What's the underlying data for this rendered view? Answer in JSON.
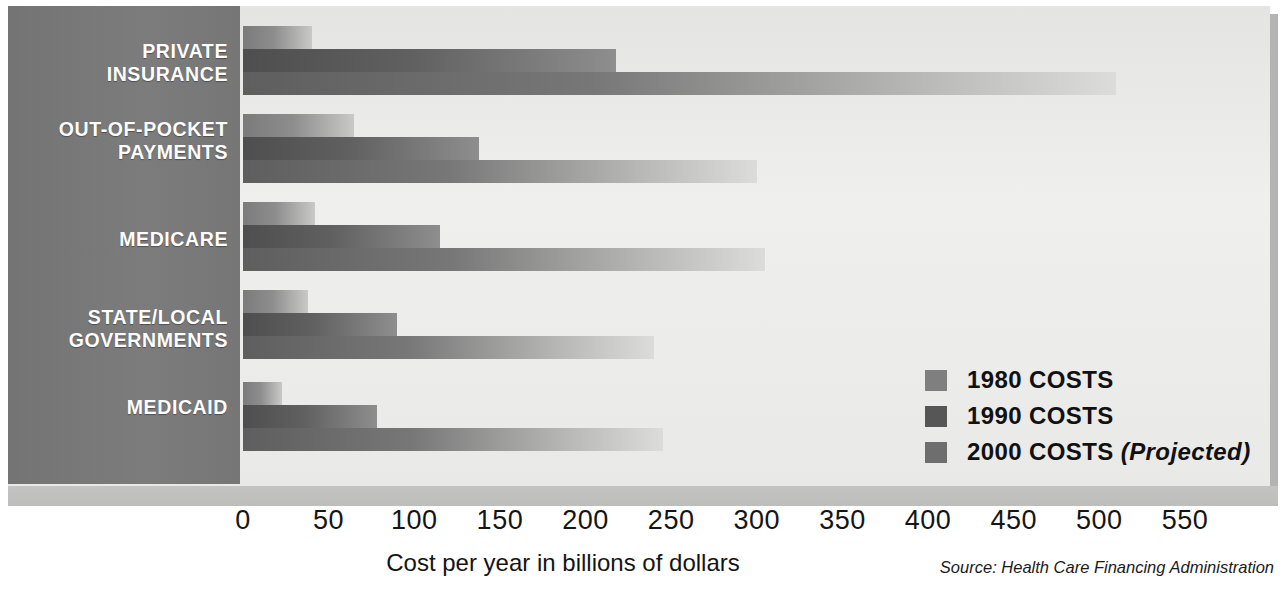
{
  "chart_data": {
    "type": "bar",
    "orientation": "horizontal",
    "title": "",
    "xlabel": "Cost per year in billions of dollars",
    "ylabel": "",
    "xlim": [
      0,
      550
    ],
    "xticks": [
      0,
      50,
      100,
      150,
      200,
      250,
      300,
      350,
      400,
      450,
      500,
      550
    ],
    "xtick_labels": [
      "0",
      "50",
      "100",
      "150",
      "200",
      "250",
      "300",
      "350",
      "400",
      "450",
      "500",
      "550"
    ],
    "grid": false,
    "legend_position": "inside-right",
    "categories": [
      "PRIVATE INSURANCE",
      "OUT-OF-POCKET PAYMENTS",
      "MEDICARE",
      "STATE/LOCAL GOVERNMENTS",
      "MEDICAID"
    ],
    "series": [
      {
        "name": "1980 COSTS",
        "color": "#8d8d8d",
        "values": [
          40,
          65,
          42,
          38,
          23
        ]
      },
      {
        "name": "1990 COSTS",
        "color": "#585858",
        "values": [
          218,
          138,
          115,
          90,
          78
        ]
      },
      {
        "name": "2000 COSTS (Projected)",
        "color": "#6f6f6f",
        "values": [
          510,
          300,
          305,
          240,
          245
        ]
      }
    ],
    "source": "Source: Health Care Financing Administration"
  },
  "sidebar": {
    "categories": [
      {
        "label": "PRIVATE\nINSURANCE"
      },
      {
        "label": "OUT-OF-POCKET\nPAYMENTS"
      },
      {
        "label": "MEDICARE"
      },
      {
        "label": "STATE/LOCAL\nGOVERNMENTS"
      },
      {
        "label": "MEDICAID"
      }
    ]
  },
  "legend": {
    "items": [
      {
        "label": "1980 COSTS",
        "suffix": ""
      },
      {
        "label": "1990 COSTS",
        "suffix": ""
      },
      {
        "label": "2000 COSTS",
        "suffix": " (Projected)"
      }
    ]
  },
  "axis": {
    "title": "Cost per year in billions of dollars"
  },
  "footer": {
    "source": "Source: Health Care Financing Administration"
  }
}
